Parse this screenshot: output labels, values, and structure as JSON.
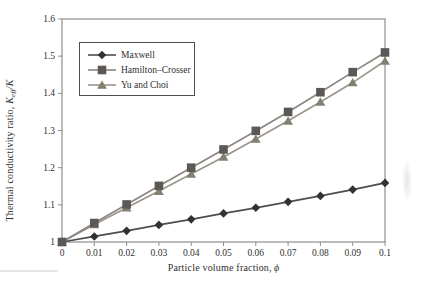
{
  "figure": {
    "background": "#ffffff",
    "frame_color": "#8e8e8e",
    "tick_text_color": "#2f2f2f"
  },
  "chart_data": {
    "type": "line",
    "title": "",
    "xlabel": "Particle volume fraction, ϕ",
    "xlabel_parts": {
      "prefix": "Particle volume fraction, ",
      "symbol": "ϕ"
    },
    "ylabel": "Thermal conductivity ratio, Keff/K",
    "ylabel_parts": {
      "prefix": "Thermal conductivity ratio, ",
      "var": "K",
      "sub": "eff",
      "suffix": "/K"
    },
    "xlim": [
      0,
      0.1
    ],
    "ylim": [
      1.0,
      1.6
    ],
    "grid": false,
    "x_ticks": [
      0,
      0.01,
      0.02,
      0.03,
      0.04,
      0.05,
      0.06,
      0.07,
      0.08,
      0.09,
      0.1
    ],
    "x_tick_labels": [
      "0",
      "0.01",
      "0.02",
      "0.03",
      "0.04",
      "0.05",
      "0.06",
      "0.07",
      "0.08",
      "0.09",
      "0.1"
    ],
    "y_ticks": [
      1.0,
      1.1,
      1.2,
      1.3,
      1.4,
      1.5,
      1.6
    ],
    "y_tick_labels": [
      "1",
      "1.1",
      "1.2",
      "1.3",
      "1.4",
      "1.5",
      "1.6"
    ],
    "legend": {
      "position": "upper-left",
      "border_color": "#4f4f4f"
    },
    "x": [
      0,
      0.01,
      0.02,
      0.03,
      0.04,
      0.05,
      0.06,
      0.07,
      0.08,
      0.09,
      0.1
    ],
    "series": [
      {
        "name": "Maxwell",
        "marker": "diamond",
        "line_color": "#4d4d4f",
        "marker_color": "#323234",
        "values": [
          1.0,
          1.015,
          1.03,
          1.046,
          1.061,
          1.077,
          1.092,
          1.108,
          1.124,
          1.141,
          1.159
        ]
      },
      {
        "name": "Hamilton–Crosser",
        "marker": "square",
        "line_color": "#8a8681",
        "marker_color": "#5c5855",
        "values": [
          1.0,
          1.051,
          1.101,
          1.151,
          1.2,
          1.249,
          1.299,
          1.35,
          1.403,
          1.457,
          1.51
        ]
      },
      {
        "name": "Yu and Choi",
        "marker": "triangle",
        "line_color": "#9a968e",
        "marker_color": "#84806f",
        "values": [
          1.0,
          1.047,
          1.092,
          1.137,
          1.183,
          1.229,
          1.277,
          1.326,
          1.377,
          1.429,
          1.487
        ]
      }
    ]
  }
}
